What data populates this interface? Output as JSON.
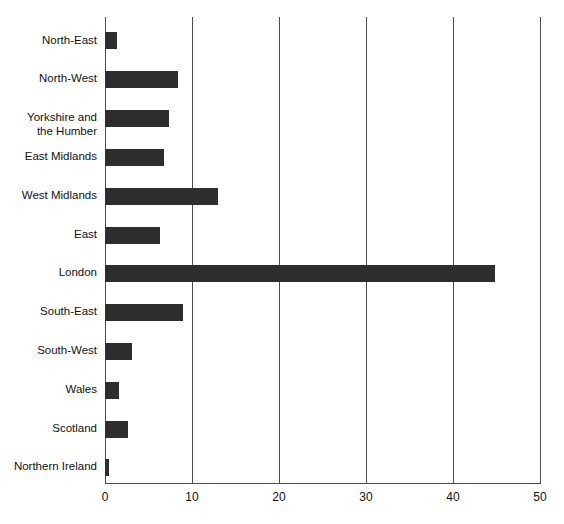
{
  "chart": {
    "type": "bar",
    "orientation": "horizontal",
    "title": "",
    "xlabel": "",
    "ylabel": "",
    "bar_color": "#2e2e2e",
    "grid_color": "#4d4d4d"
  },
  "chart_data": {
    "type": "bar",
    "orientation": "horizontal",
    "title": "",
    "subtitle": "",
    "xlabel": "",
    "ylabel": "",
    "categories": [
      "North-East",
      "North-West",
      "Yorkshire and\nthe Humber",
      "East Midlands",
      "West Midlands",
      "East",
      "London",
      "South-East",
      "South-West",
      "Wales",
      "Scotland",
      "Northern Ireland"
    ],
    "values": [
      1.4,
      8.4,
      7.4,
      6.8,
      13.0,
      6.3,
      44.8,
      9.0,
      3.1,
      1.6,
      2.6,
      0.5
    ],
    "xlim": [
      0,
      50
    ],
    "xticks": [
      0,
      10,
      20,
      30,
      40,
      50
    ],
    "xticklabels": [
      "0",
      "10",
      "20",
      "30",
      "40",
      "50"
    ],
    "grid": "vertical-only",
    "legend": "none",
    "annotations": []
  }
}
